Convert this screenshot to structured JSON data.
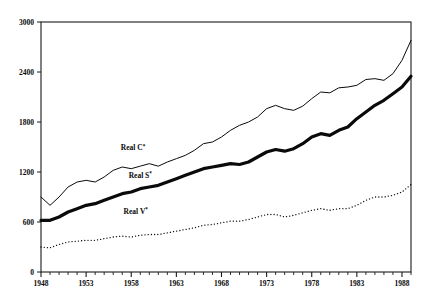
{
  "chart_data": {
    "type": "line",
    "title": "",
    "subtitle": "",
    "xlabel": "",
    "ylabel": "",
    "xlim": [
      1948,
      1989
    ],
    "ylim": [
      0,
      3000
    ],
    "grid": false,
    "legend_position": "inline-annotations",
    "x_ticks_major": [
      1948,
      1953,
      1958,
      1963,
      1968,
      1973,
      1978,
      1983,
      1988
    ],
    "x_tick_labels": [
      "1948",
      "1953",
      "1958",
      "1963",
      "1968",
      "1973",
      "1978",
      "1983",
      "1988"
    ],
    "x_minor_tick_interval": 1,
    "y_ticks": [
      0,
      600,
      1200,
      1800,
      2400,
      3000
    ],
    "y_tick_labels": [
      "0",
      "600",
      "1200",
      "1800",
      "2400",
      "3000"
    ],
    "x": [
      1948,
      1949,
      1950,
      1951,
      1952,
      1953,
      1954,
      1955,
      1956,
      1957,
      1958,
      1959,
      1960,
      1961,
      1962,
      1963,
      1964,
      1965,
      1966,
      1967,
      1968,
      1969,
      1970,
      1971,
      1972,
      1973,
      1974,
      1975,
      1976,
      1977,
      1978,
      1979,
      1980,
      1981,
      1982,
      1983,
      1984,
      1985,
      1986,
      1987,
      1988,
      1989
    ],
    "series": [
      {
        "name": "Real C*",
        "label": "Real C",
        "label_superscript": "*",
        "style": "thin-solid",
        "color": "#0a0a0a",
        "line_width": 1.0,
        "label_x": 1958.2,
        "label_y": 1460,
        "values": [
          900,
          800,
          900,
          1020,
          1080,
          1100,
          1080,
          1140,
          1220,
          1260,
          1240,
          1270,
          1300,
          1270,
          1320,
          1360,
          1400,
          1460,
          1540,
          1560,
          1620,
          1700,
          1760,
          1800,
          1860,
          1960,
          2000,
          1960,
          1940,
          1990,
          2080,
          2160,
          2150,
          2210,
          2220,
          2240,
          2310,
          2320,
          2300,
          2380,
          2540,
          2780
        ]
      },
      {
        "name": "Real S*",
        "label": "Real S",
        "label_superscript": "*",
        "style": "thick-solid",
        "color": "#0a0a0a",
        "line_width": 3.2,
        "label_x": 1959.0,
        "label_y": 1130,
        "values": [
          620,
          620,
          660,
          720,
          760,
          800,
          820,
          860,
          900,
          940,
          960,
          1000,
          1020,
          1040,
          1080,
          1120,
          1160,
          1200,
          1240,
          1260,
          1280,
          1300,
          1290,
          1320,
          1380,
          1440,
          1470,
          1450,
          1480,
          1540,
          1620,
          1660,
          1640,
          1700,
          1740,
          1840,
          1920,
          2000,
          2060,
          2140,
          2220,
          2350
        ]
      },
      {
        "name": "Real V*",
        "label": "Real V",
        "label_superscript": "*",
        "style": "dotted",
        "color": "#0a0a0a",
        "line_width": 1.3,
        "label_x": 1958.5,
        "label_y": 700,
        "values": [
          300,
          290,
          330,
          360,
          370,
          380,
          380,
          400,
          420,
          430,
          420,
          440,
          450,
          450,
          470,
          490,
          510,
          530,
          560,
          570,
          590,
          610,
          610,
          630,
          660,
          690,
          690,
          660,
          680,
          710,
          740,
          760,
          740,
          760,
          760,
          800,
          860,
          900,
          900,
          920,
          960,
          1050
        ]
      }
    ]
  },
  "plot_geometry": {
    "left": 41,
    "right": 411,
    "top": 22,
    "bottom": 272
  }
}
